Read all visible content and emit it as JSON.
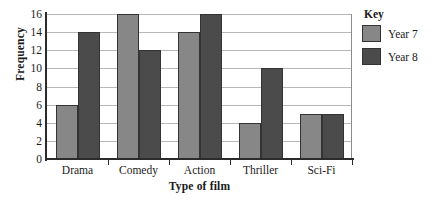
{
  "chart_data": {
    "type": "bar",
    "title": "",
    "xlabel": "Type of film",
    "ylabel": "Frequency",
    "categories": [
      "Drama",
      "Comedy",
      "Action",
      "Thriller",
      "Sci-Fi"
    ],
    "series": [
      {
        "name": "Year 7",
        "color": "#878787",
        "values": [
          6,
          16,
          14,
          4,
          5
        ]
      },
      {
        "name": "Year 8",
        "color": "#4b4b4b",
        "values": [
          14,
          12,
          16,
          10,
          5
        ]
      }
    ],
    "ylim": [
      0,
      16
    ],
    "ytick_step": 2,
    "yticks": [
      0,
      2,
      4,
      6,
      8,
      10,
      12,
      14,
      16
    ],
    "ytick_labels": [
      "0",
      "2",
      "4",
      "6",
      "8",
      "10",
      "12",
      "14",
      "16"
    ],
    "grid": "horizontal",
    "legend_position": "right",
    "legend_title": "Key"
  },
  "legend": {
    "title": "Key",
    "entries": [
      {
        "label": "Year 7",
        "color": "#878787"
      },
      {
        "label": "Year 8",
        "color": "#4b4b4b"
      }
    ]
  },
  "axes": {
    "y_title": "Frequency",
    "x_title": "Type of film"
  }
}
